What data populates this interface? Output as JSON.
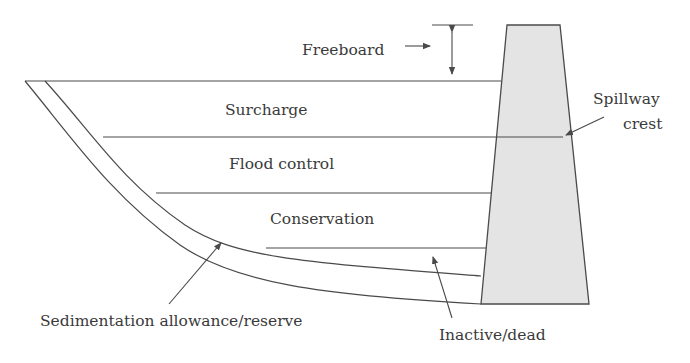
{
  "diagram": {
    "title": "",
    "type": "reservoir storage zones cross-section",
    "colors": {
      "line": "#4a4a4a",
      "dam_fill": "#e4e4e4",
      "text": "#3a3a3a",
      "background": "#ffffff"
    },
    "labels": {
      "freeboard": "Freeboard",
      "surcharge": "Surcharge",
      "flood_control": "Flood control",
      "conservation": "Conservation",
      "spillway_line1": "Spillway",
      "spillway_line2": "crest",
      "sedimentation": "Sedimentation allowance/reserve",
      "inactive": "Inactive/dead"
    },
    "zones": [
      {
        "name": "Freeboard",
        "order": 1
      },
      {
        "name": "Surcharge",
        "order": 2
      },
      {
        "name": "Flood control",
        "order": 3
      },
      {
        "name": "Conservation",
        "order": 4
      },
      {
        "name": "Inactive/dead",
        "order": 5
      },
      {
        "name": "Sedimentation allowance/reserve",
        "order": 6
      }
    ],
    "components": [
      "dam",
      "spillway crest",
      "reservoir bed"
    ]
  }
}
